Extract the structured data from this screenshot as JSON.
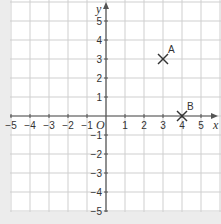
{
  "chart_data": {
    "type": "scatter",
    "title": "",
    "xlabel": "x",
    "ylabel": "y",
    "origin_label": "O",
    "xlim": [
      -5.5,
      5.5
    ],
    "ylim": [
      -5,
      5.5
    ],
    "grid": true,
    "x_ticks": [
      -5,
      -4,
      -3,
      -2,
      -1,
      1,
      2,
      3,
      4,
      5
    ],
    "y_ticks": [
      -5,
      -4,
      -3,
      -2,
      -1,
      1,
      2,
      3,
      4,
      5
    ],
    "x_tick_labels": [
      "−5",
      "−4",
      "−3",
      "−2",
      "−1",
      "1",
      "2",
      "3",
      "4",
      "5"
    ],
    "y_tick_labels": [
      "−5",
      "−4",
      "−3",
      "−2",
      "−1",
      "1",
      "2",
      "3",
      "4",
      "5"
    ],
    "points": [
      {
        "label": "A",
        "x": 3,
        "y": 3,
        "marker": "x"
      },
      {
        "label": "B",
        "x": 4,
        "y": 0,
        "marker": "x"
      }
    ]
  },
  "colors": {
    "background": "#ececec",
    "plot_area": "#ffffff",
    "grid": "#cfcfcf",
    "axis": "#555555",
    "marker": "#333333"
  }
}
